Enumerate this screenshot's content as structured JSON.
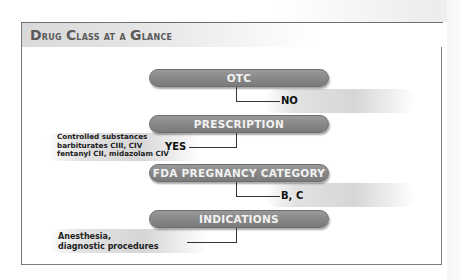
{
  "title": {
    "word1_cap": "D",
    "word1_rest": "rug",
    "word2_cap": "C",
    "word2_rest": "lass",
    "rest": "at a",
    "word3_cap": "G",
    "word3_rest": "lance"
  },
  "nodes": [
    {
      "label": "OTC",
      "answer": "NO"
    },
    {
      "label": "PRESCRIPTION",
      "answer": "YES",
      "note": [
        "Controlled substances",
        "barbiturates CIII, CIV",
        "fentanyl CII, midazolam CIV"
      ]
    },
    {
      "label": "FDA PREGNANCY CATEGORY",
      "answer": "B, C"
    },
    {
      "label": "INDICATIONS",
      "answer": "",
      "note": [
        "Anesthesia,",
        "diagnostic procedures"
      ]
    }
  ]
}
